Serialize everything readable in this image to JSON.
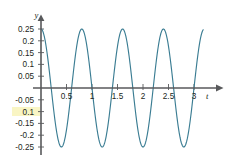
{
  "figure": {
    "background_color": "#ffffff",
    "curve_color": "#3b7d93",
    "axis_color": "#58595b",
    "text_color": "#231f20",
    "highlight_color": "#f7f2b0"
  },
  "axes": {
    "x_axis_name": "t",
    "y_axis_name": "y"
  },
  "chart_data": {
    "type": "line",
    "title": "",
    "subtitle": "",
    "xlabel": "t",
    "ylabel": "y",
    "xlim": [
      0,
      3.18
    ],
    "ylim": [
      -0.27,
      0.27
    ],
    "grid": false,
    "legend": null,
    "x_ticks": [
      0.5,
      1,
      1.5,
      2,
      2.5,
      3
    ],
    "x_tick_labels": [
      "0.5",
      "1",
      "1.5",
      "2",
      "2.5",
      "3"
    ],
    "y_ticks": [
      0.25,
      0.2,
      0.15,
      0.1,
      0.05,
      -0.05,
      -0.1,
      -0.15,
      -0.2,
      -0.25
    ],
    "y_tick_labels": [
      "0.25",
      "0.2",
      "0.15",
      "0.1",
      "0.05",
      "-0.05",
      "0.1",
      "-0.15",
      "-0.2",
      "-0.25"
    ],
    "series": [
      {
        "name": "y(t)",
        "color": "#3b7d93",
        "function": "0.25*cos(2*pi*1.25*t)",
        "amplitude": 0.25,
        "period": 0.8,
        "frequency": 1.25,
        "phase": 0,
        "x": [
          0,
          0.05,
          0.1,
          0.15,
          0.2,
          0.25,
          0.3,
          0.35,
          0.4,
          0.45,
          0.5,
          0.55,
          0.6,
          0.65,
          0.7,
          0.75,
          0.8,
          0.85,
          0.9,
          0.95,
          1,
          1.05,
          1.1,
          1.15,
          1.2,
          1.25,
          1.3,
          1.35,
          1.4,
          1.45,
          1.5,
          1.55,
          1.6,
          1.65,
          1.7,
          1.75,
          1.8,
          1.85,
          1.9,
          1.95,
          2,
          2.05,
          2.1,
          2.15,
          2.2,
          2.25,
          2.3,
          2.35,
          2.4,
          2.45,
          2.5,
          2.55,
          2.6,
          2.65,
          2.7,
          2.75,
          2.8,
          2.85,
          2.9,
          2.95,
          3,
          3.05,
          3.1,
          3.15
        ],
        "values": [
          0.25,
          0.231,
          0.177,
          0.096,
          0,
          -0.096,
          -0.177,
          -0.231,
          -0.25,
          -0.231,
          -0.177,
          -0.096,
          0,
          0.096,
          0.177,
          0.231,
          0.25,
          0.231,
          0.177,
          0.096,
          0,
          -0.096,
          -0.177,
          -0.231,
          -0.25,
          -0.231,
          -0.177,
          -0.096,
          0,
          0.096,
          0.177,
          0.231,
          0.25,
          0.231,
          0.177,
          0.096,
          0,
          -0.096,
          -0.177,
          -0.231,
          -0.25,
          -0.231,
          -0.177,
          -0.096,
          0,
          0.096,
          0.177,
          0.231,
          0.25,
          0.231,
          0.177,
          0.096,
          0,
          -0.096,
          -0.177,
          -0.231,
          -0.25,
          -0.231,
          -0.177,
          -0.096,
          0,
          0.096,
          0.177,
          0.231
        ]
      }
    ],
    "maxima_t": [
      0,
      0.8,
      1.6,
      2.4,
      3.2
    ],
    "minima_t": [
      0.4,
      1.2,
      2.0,
      2.8
    ],
    "zero_crossings_t": [
      0.2,
      0.6,
      1.0,
      1.4,
      1.8,
      2.2,
      2.6,
      3.0
    ]
  }
}
